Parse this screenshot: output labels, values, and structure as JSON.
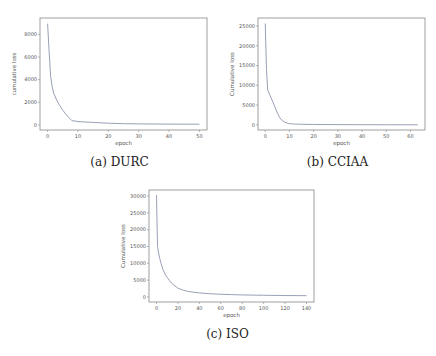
{
  "chart_data": [
    {
      "type": "line",
      "title": "",
      "caption": "(a) DURC",
      "xlabel": "epoch",
      "ylabel": "cumulative loss",
      "xlim": [
        -2.5,
        52.5
      ],
      "ylim": [
        -450,
        9450
      ],
      "xticks": [
        0,
        10,
        20,
        30,
        40,
        50
      ],
      "yticks": [
        0,
        2000,
        4000,
        6000,
        8000
      ],
      "grid": false,
      "series": [
        {
          "name": "cumulative loss",
          "x": [
            0,
            0.5,
            1,
            1.5,
            2,
            3,
            4,
            5,
            6,
            7,
            8,
            10,
            12,
            15,
            20,
            25,
            30,
            35,
            40,
            45,
            50
          ],
          "y": [
            8950,
            6500,
            4300,
            3400,
            2800,
            2200,
            1700,
            1300,
            950,
            650,
            380,
            300,
            260,
            220,
            150,
            110,
            90,
            80,
            70,
            65,
            60
          ]
        }
      ]
    },
    {
      "type": "line",
      "title": "",
      "caption": "(b) CCIAA",
      "xlabel": "epoch",
      "ylabel": "Cumulative loss",
      "xlim": [
        -3,
        66
      ],
      "ylim": [
        -1300,
        27000
      ],
      "xticks": [
        0,
        10,
        20,
        30,
        40,
        50,
        60
      ],
      "yticks": [
        0,
        5000,
        10000,
        15000,
        20000,
        25000
      ],
      "grid": false,
      "series": [
        {
          "name": "cumulative loss",
          "x": [
            0,
            0.5,
            1,
            2,
            3,
            4,
            5,
            6,
            7,
            8,
            9,
            10,
            12,
            15,
            20,
            30,
            40,
            50,
            63
          ],
          "y": [
            25600,
            14000,
            8800,
            7400,
            6000,
            4500,
            3000,
            1800,
            1100,
            700,
            450,
            300,
            200,
            150,
            100,
            60,
            40,
            30,
            20
          ]
        }
      ]
    },
    {
      "type": "line",
      "title": "",
      "caption": "(c) ISO",
      "xlabel": "epoch",
      "ylabel": "Cumulative loss",
      "xlim": [
        -7,
        147
      ],
      "ylim": [
        -1500,
        31800
      ],
      "xticks": [
        0,
        20,
        40,
        60,
        80,
        100,
        120,
        140
      ],
      "yticks": [
        0,
        5000,
        10000,
        15000,
        20000,
        25000,
        30000
      ],
      "grid": false,
      "series": [
        {
          "name": "cumulative loss",
          "x": [
            0,
            0.5,
            1,
            2,
            3,
            4,
            6,
            8,
            10,
            12,
            15,
            20,
            25,
            30,
            40,
            50,
            60,
            70,
            80,
            100,
            120,
            140
          ],
          "y": [
            30300,
            22000,
            15000,
            13000,
            11500,
            10200,
            8200,
            6800,
            5800,
            4900,
            3800,
            2600,
            2000,
            1600,
            1200,
            950,
            800,
            700,
            600,
            500,
            420,
            380
          ]
        }
      ]
    }
  ]
}
